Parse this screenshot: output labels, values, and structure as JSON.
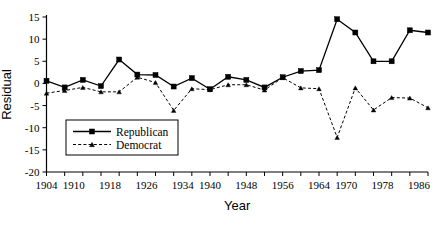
{
  "chart_data": {
    "type": "line",
    "title": "",
    "xlabel": "Year",
    "ylabel": "Residual",
    "xlim": [
      1904,
      1988
    ],
    "ylim": [
      -20,
      15
    ],
    "ytick_values": [
      15,
      10,
      5,
      0,
      -5,
      -10,
      -15,
      -20
    ],
    "ytick_labels": [
      "15",
      "10",
      "5",
      "0",
      "-5",
      "-10",
      "-15",
      "-20"
    ],
    "xtick_values": [
      1904,
      1908,
      1912,
      1916,
      1920,
      1924,
      1928,
      1932,
      1936,
      1940,
      1944,
      1948,
      1952,
      1956,
      1960,
      1964,
      1968,
      1972,
      1976,
      1980,
      1984,
      1988
    ],
    "xtick_labeled": [
      {
        "value": 1904,
        "label": "1904"
      },
      {
        "value": 1910,
        "label": "1910"
      },
      {
        "value": 1918,
        "label": "1918"
      },
      {
        "value": 1926,
        "label": "1926"
      },
      {
        "value": 1934,
        "label": "1934"
      },
      {
        "value": 1940,
        "label": "1940"
      },
      {
        "value": 1948,
        "label": "1948"
      },
      {
        "value": 1956,
        "label": "1956"
      },
      {
        "value": 1964,
        "label": "1964"
      },
      {
        "value": 1970,
        "label": "1970"
      },
      {
        "value": 1978,
        "label": "1978"
      },
      {
        "value": 1986,
        "label": "1986"
      }
    ],
    "grid": false,
    "legend_position": "lower left",
    "x": [
      1904,
      1908,
      1912,
      1916,
      1920,
      1924,
      1928,
      1932,
      1936,
      1940,
      1944,
      1948,
      1952,
      1956,
      1960,
      1964,
      1968,
      1972,
      1976,
      1980,
      1984,
      1988
    ],
    "series": [
      {
        "name": "Republican",
        "marker": "square",
        "linestyle": "solid",
        "values": [
          0.6,
          -0.9,
          0.8,
          -0.6,
          5.4,
          2.0,
          1.9,
          -0.7,
          1.2,
          -1.3,
          1.5,
          0.8,
          -0.9,
          1.4,
          2.8,
          3.0,
          14.5,
          11.5,
          5.0,
          5.0,
          12.0,
          11.5
        ]
      },
      {
        "name": "Democrat",
        "marker": "triangle",
        "linestyle": "dashed",
        "values": [
          -2.2,
          -1.6,
          -0.9,
          -1.9,
          -1.9,
          1.4,
          0.2,
          -6.1,
          -1.2,
          -1.4,
          -0.3,
          -0.3,
          -1.5,
          1.3,
          -1.0,
          -1.2,
          -12.2,
          -1.0,
          -6.0,
          -3.2,
          -3.3,
          -5.5
        ]
      }
    ],
    "series_extra_note": ""
  },
  "legend": {
    "entries": [
      {
        "label": "Republican"
      },
      {
        "label": "Democrat"
      }
    ]
  },
  "axes": {
    "x_title": "Year",
    "y_title": "Residual"
  }
}
